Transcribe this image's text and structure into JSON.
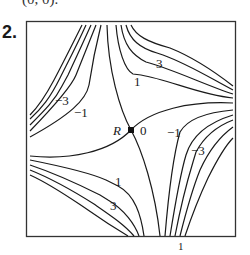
{
  "header": {
    "cut_text": "(0, 0).",
    "problem_number": "2."
  },
  "figure": {
    "type": "contour-plot",
    "saddle_point_label": "R",
    "zero_label": "0",
    "contour_labels": [
      {
        "text": "3",
        "pos": "upper-right"
      },
      {
        "text": "1",
        "pos": "upper-right-inner"
      },
      {
        "text": "−3",
        "pos": "upper-left"
      },
      {
        "text": "−1",
        "pos": "upper-left-inner"
      },
      {
        "text": "−1",
        "pos": "lower-right-inner"
      },
      {
        "text": "−3",
        "pos": "lower-right"
      },
      {
        "text": "1",
        "pos": "lower-left-inner"
      },
      {
        "text": "3",
        "pos": "lower-left"
      }
    ]
  },
  "footer": {
    "page_marker": "1"
  }
}
